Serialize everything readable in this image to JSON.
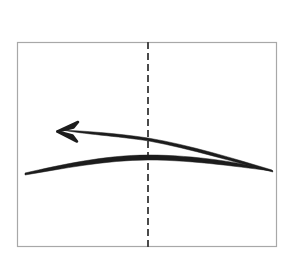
{
  "figure": {
    "title": "Origami fold step diagram",
    "description": "A rectangular sheet with a vertical dashed crease line down the middle and a curved arrow sweeping from the lower right edge toward the left.",
    "background_color": "#ffffff",
    "canvas": {
      "width": 301,
      "height": 256
    }
  },
  "sheet": {
    "label": "paper-sheet",
    "border_color": "#a8a8a8",
    "fill_color": "#ffffff",
    "stroke_width": 1,
    "x": 17,
    "y": 42,
    "width": 260,
    "height": 205
  },
  "crease": {
    "label": "Center crease line",
    "type": "valley-fold-dashed",
    "color": "#4a4a4a",
    "stroke_width": 2,
    "dash_length": 7,
    "dash_gap": 4,
    "x": 148,
    "y_top": 42,
    "y_bottom": 247
  },
  "arrow": {
    "label": "Fold direction arrow",
    "color": "#1c1c1c",
    "direction": "right-to-left",
    "head": {
      "tip_x": 58,
      "tip_y": 131,
      "barb_upper_x": 76,
      "barb_upper_y": 123,
      "barb_lower_x": 75,
      "barb_lower_y": 141
    },
    "shaft": {
      "start_x": 272,
      "start_y": 170,
      "end_x": 60,
      "end_y": 131,
      "control_x": 150,
      "control_y": 131
    }
  },
  "edge_curve": {
    "label": "Folded paper edge",
    "color": "#1c1c1c",
    "start_x": 25,
    "start_y": 173,
    "end_x": 273,
    "end_y": 171,
    "control_x": 150,
    "control_y": 148,
    "max_stroke_width": 3.2
  },
  "chart_data": {
    "type": "line",
    "title": "Origami fold step diagram",
    "xlabel": "",
    "ylabel": "",
    "xlim": [
      17,
      277
    ],
    "ylim": [
      42,
      247
    ],
    "grid": false,
    "legend": "none",
    "annotations": [
      {
        "text": "Center crease (dashed vertical line)",
        "x": 148,
        "y": 145
      },
      {
        "text": "Fold arrow pointing left",
        "x": 58,
        "y": 131
      }
    ],
    "series": [
      {
        "name": "Folded paper edge",
        "points": [
          [
            25,
            173
          ],
          [
            50,
            166
          ],
          [
            75,
            161
          ],
          [
            100,
            157
          ],
          [
            125,
            156
          ],
          [
            148,
            156
          ],
          [
            175,
            157
          ],
          [
            200,
            160
          ],
          [
            225,
            163
          ],
          [
            250,
            167
          ],
          [
            273,
            171
          ]
        ]
      },
      {
        "name": "Fold direction arrow shaft",
        "points": [
          [
            60,
            131
          ],
          [
            85,
            132
          ],
          [
            110,
            133
          ],
          [
            135,
            135
          ],
          [
            148,
            136
          ],
          [
            175,
            141
          ],
          [
            200,
            148
          ],
          [
            225,
            155
          ],
          [
            250,
            163
          ],
          [
            272,
            170
          ]
        ]
      },
      {
        "name": "Center crease line",
        "points": [
          [
            148,
            42
          ],
          [
            148,
            247
          ]
        ]
      }
    ]
  }
}
